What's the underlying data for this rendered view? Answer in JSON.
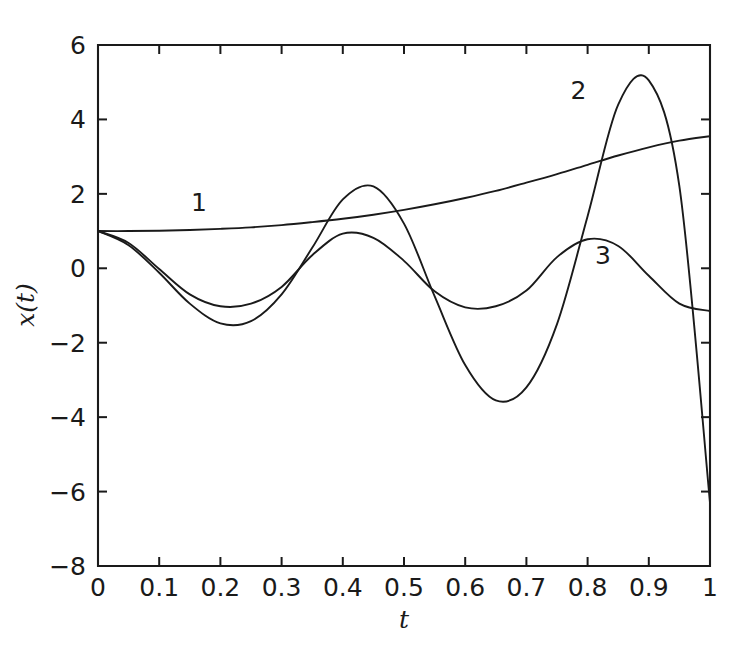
{
  "chart_data": {
    "type": "line",
    "title": "",
    "xlabel": "t",
    "ylabel": "x(t)",
    "xlim": [
      0,
      1
    ],
    "ylim": [
      -8,
      6
    ],
    "grid": false,
    "legend": "inline-curve-numbers",
    "xticks": [
      "0",
      "0.1",
      "0.2",
      "0.3",
      "0.4",
      "0.5",
      "0.6",
      "0.7",
      "0.8",
      "0.9",
      "1"
    ],
    "xtick_values": [
      0,
      0.1,
      0.2,
      0.3,
      0.4,
      0.5,
      0.6,
      0.7,
      0.8,
      0.9,
      1
    ],
    "yticks": [
      "6",
      "4",
      "2",
      "0",
      "-2",
      "-4",
      "-6",
      "-8"
    ],
    "ytick_values": [
      6,
      4,
      2,
      0,
      -2,
      -4,
      -6,
      -8
    ],
    "annotations": [
      {
        "text": "1",
        "x": 0.165,
        "y": 1.55,
        "curve": "1"
      },
      {
        "text": "2",
        "x": 0.785,
        "y": 4.55,
        "curve": "2"
      },
      {
        "text": "3",
        "x": 0.825,
        "y": 0.12,
        "curve": "3"
      }
    ],
    "series": [
      {
        "name": "1",
        "x": [
          0,
          0.05,
          0.1,
          0.15,
          0.2,
          0.25,
          0.3,
          0.35,
          0.4,
          0.45,
          0.5,
          0.55,
          0.6,
          0.65,
          0.7,
          0.75,
          0.8,
          0.85,
          0.9,
          0.95,
          1
        ],
        "values": [
          1.0,
          1.0,
          1.01,
          1.03,
          1.06,
          1.1,
          1.16,
          1.24,
          1.33,
          1.44,
          1.57,
          1.72,
          1.89,
          2.08,
          2.3,
          2.53,
          2.78,
          3.03,
          3.25,
          3.43,
          3.55
        ]
      },
      {
        "name": "2",
        "x": [
          0,
          0.05,
          0.1,
          0.15,
          0.2,
          0.25,
          0.3,
          0.35,
          0.4,
          0.45,
          0.5,
          0.55,
          0.6,
          0.65,
          0.7,
          0.75,
          0.8,
          0.85,
          0.9,
          0.95,
          1
        ],
        "values": [
          1.0,
          0.62,
          -0.12,
          -0.95,
          -1.48,
          -1.42,
          -0.7,
          0.55,
          1.85,
          2.2,
          1.2,
          -0.75,
          -2.6,
          -3.55,
          -3.2,
          -1.5,
          1.4,
          4.4,
          5.05,
          2.2,
          -6.3
        ]
      },
      {
        "name": "3",
        "x": [
          0,
          0.05,
          0.1,
          0.15,
          0.2,
          0.25,
          0.3,
          0.35,
          0.4,
          0.45,
          0.5,
          0.55,
          0.6,
          0.65,
          0.7,
          0.75,
          0.8,
          0.85,
          0.9,
          0.95,
          1
        ],
        "values": [
          1.0,
          0.68,
          -0.02,
          -0.7,
          -1.02,
          -0.95,
          -0.5,
          0.35,
          0.93,
          0.82,
          0.2,
          -0.62,
          -1.05,
          -1.02,
          -0.6,
          0.3,
          0.78,
          0.6,
          -0.2,
          -0.95,
          -1.15
        ]
      }
    ]
  },
  "plot_geometry": {
    "left": 98,
    "right": 710,
    "top": 45,
    "bottom": 566
  },
  "colors": {
    "background": "#ffffff",
    "axis": "#1a1a1a",
    "curve": "#1a1a1a"
  }
}
